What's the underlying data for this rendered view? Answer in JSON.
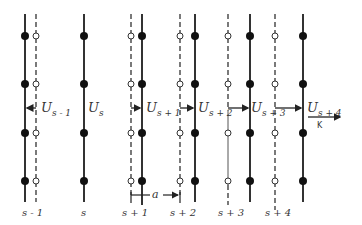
{
  "diagram": {
    "plane_labels": [
      "s - 1",
      "s",
      "s + 1",
      "s + 2",
      "s + 3",
      "s + 4"
    ],
    "displacement_labels": {
      "u_sm1": {
        "main": "U",
        "sub": "s - 1"
      },
      "u_s": {
        "main": "U",
        "sub": "s"
      },
      "u_sp1": {
        "main": "U",
        "sub": "s + 1"
      },
      "u_sp2": {
        "main": "U",
        "sub": "s + 2"
      },
      "u_sp3": {
        "main": "U",
        "sub": "s + 3"
      },
      "u_sp4": {
        "main": "U",
        "sub": "s + 4"
      }
    },
    "spacing_label": "a",
    "wavevector_label": "K",
    "colors": {
      "line": "#333333",
      "atom": "#111111",
      "equilibrium_atom_fill": "#ffffff"
    }
  }
}
